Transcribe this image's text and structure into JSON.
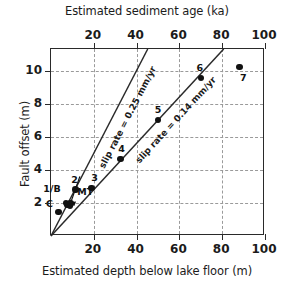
{
  "chart_data": {
    "type": "scatter",
    "title": "",
    "xlabel": "Estimated depth below lake floor (m)",
    "xlabel_top": "Estimated sediment age (ka)",
    "ylabel": "Fault offset (m)",
    "xlim": [
      0,
      100
    ],
    "ylim": [
      0,
      11.3
    ],
    "grid": true,
    "legend": "none",
    "xticks": [
      20,
      40,
      60,
      80,
      100
    ],
    "xticklabels": [
      "20",
      "40",
      "60",
      "80",
      "100"
    ],
    "xticks_top": [
      20,
      40,
      60,
      80,
      100
    ],
    "xticklabels_top": [
      "20",
      "40",
      "60",
      "80",
      "100"
    ],
    "yticks": [
      2,
      4,
      6,
      8,
      10
    ],
    "yticklabels": [
      "2",
      "4",
      "6",
      "8",
      "10"
    ],
    "points": [
      {
        "label": "C",
        "x": 3.5,
        "y": 1.45,
        "label_dx": -9,
        "label_dy": -9
      },
      {
        "label": "1/B",
        "x": 7.0,
        "y": 2.0,
        "label_dx": -14,
        "label_dy": -15
      },
      {
        "label": "MT",
        "x": 9.0,
        "y": 1.95,
        "label_dx": 15,
        "label_dy": -13
      },
      {
        "label": "2",
        "x": 11.5,
        "y": 2.8,
        "label_dx": -1,
        "label_dy": -11
      },
      {
        "label": "3",
        "x": 19.0,
        "y": 2.9,
        "label_dx": 3,
        "label_dy": -11
      },
      {
        "label": "4",
        "x": 32.5,
        "y": 4.65,
        "label_dx": 1,
        "label_dy": -11
      },
      {
        "label": "5",
        "x": 50.0,
        "y": 7.0,
        "label_dx": 0,
        "label_dy": -11
      },
      {
        "label": "6",
        "x": 70.0,
        "y": 9.55,
        "label_dx": -1,
        "label_dy": -11
      },
      {
        "label": "7",
        "x": 88.0,
        "y": 10.2,
        "label_dx": 4,
        "label_dy": 10
      }
    ],
    "extra_markers": [
      {
        "x": 7.6,
        "y": 1.88
      },
      {
        "x": 8.8,
        "y": 1.82
      }
    ],
    "lines": [
      {
        "name": "slip-rate-0.25",
        "label": "slip rate = 0.25 mm/yr",
        "slope": 0.25,
        "from": [
          0,
          0
        ],
        "to": [
          45.2,
          11.3
        ]
      },
      {
        "name": "slip-rate-0.14",
        "label": "slip rate = 0.14 mm/yr",
        "slope": 0.14,
        "from": [
          0,
          0
        ],
        "to": [
          80.7,
          11.3
        ]
      }
    ],
    "annotations": [
      {
        "name": "arrow-to-cluster",
        "text": ""
      }
    ]
  },
  "figure": {
    "top_axis_title": "Estimated sediment age (ka)",
    "bottom_axis_title": "Estimated depth below lake floor (m)",
    "y_axis_title": "Fault offset (m)",
    "rate_label_a": "slip rate = 0.25 mm/yr",
    "rate_label_b": "slip rate = 0.14 mm/yr",
    "colors": {
      "frame": "#2a2a2a",
      "grid": "#9a9a9a",
      "marker": "#111111",
      "text": "#1b1b1b",
      "background": "#ffffff"
    }
  }
}
